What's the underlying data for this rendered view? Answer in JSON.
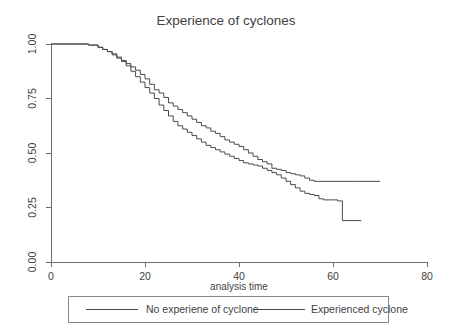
{
  "chart_data": {
    "type": "line",
    "subtype": "kaplan-meier-survival-step",
    "title": "Experience of cyclones",
    "xlabel": "analysis time",
    "ylabel": "",
    "xlim": [
      0,
      80
    ],
    "ylim": [
      0,
      1
    ],
    "xticks": [
      0,
      20,
      40,
      60,
      80
    ],
    "xtick_labels": [
      "0",
      "20",
      "40",
      "60",
      "80"
    ],
    "yticks": [
      0.0,
      0.25,
      0.5,
      0.75,
      1.0
    ],
    "ytick_labels": [
      "0.00",
      "0.25",
      "0.50",
      "0.75",
      "1.00"
    ],
    "grid": false,
    "legend_position": "below",
    "line_color": "#4a4a4a",
    "background_color": "#ffffff",
    "series": [
      {
        "name": "No experiene of cyclone",
        "color": "#4a4a4a",
        "points": [
          [
            0,
            1.0
          ],
          [
            6,
            1.0
          ],
          [
            8,
            0.995
          ],
          [
            10,
            0.985
          ],
          [
            11,
            0.975
          ],
          [
            12,
            0.965
          ],
          [
            13,
            0.95
          ],
          [
            14,
            0.935
          ],
          [
            15,
            0.92
          ],
          [
            16,
            0.9
          ],
          [
            17,
            0.875
          ],
          [
            18,
            0.85
          ],
          [
            19,
            0.825
          ],
          [
            20,
            0.8
          ],
          [
            21,
            0.775
          ],
          [
            22,
            0.75
          ],
          [
            23,
            0.72
          ],
          [
            24,
            0.695
          ],
          [
            25,
            0.67
          ],
          [
            26,
            0.645
          ],
          [
            27,
            0.625
          ],
          [
            28,
            0.61
          ],
          [
            29,
            0.595
          ],
          [
            30,
            0.58
          ],
          [
            31,
            0.565
          ],
          [
            32,
            0.55
          ],
          [
            33,
            0.535
          ],
          [
            34,
            0.525
          ],
          [
            35,
            0.515
          ],
          [
            36,
            0.505
          ],
          [
            37,
            0.495
          ],
          [
            38,
            0.485
          ],
          [
            39,
            0.475
          ],
          [
            40,
            0.465
          ],
          [
            41,
            0.455
          ],
          [
            42,
            0.45
          ],
          [
            43,
            0.445
          ],
          [
            44,
            0.44
          ],
          [
            45,
            0.43
          ],
          [
            46,
            0.42
          ],
          [
            47,
            0.41
          ],
          [
            48,
            0.4
          ],
          [
            49,
            0.385
          ],
          [
            50,
            0.37
          ],
          [
            51,
            0.355
          ],
          [
            52,
            0.34
          ],
          [
            53,
            0.325
          ],
          [
            54,
            0.315
          ],
          [
            55,
            0.31
          ],
          [
            56,
            0.305
          ],
          [
            57,
            0.29
          ],
          [
            58,
            0.285
          ],
          [
            59,
            0.285
          ],
          [
            60,
            0.285
          ],
          [
            61,
            0.28
          ],
          [
            62,
            0.19
          ],
          [
            66,
            0.19
          ]
        ]
      },
      {
        "name": "Experienced cyclone",
        "color": "#4a4a4a",
        "points": [
          [
            0,
            1.0
          ],
          [
            6,
            1.0
          ],
          [
            8,
            0.995
          ],
          [
            10,
            0.985
          ],
          [
            11,
            0.975
          ],
          [
            12,
            0.965
          ],
          [
            13,
            0.955
          ],
          [
            14,
            0.94
          ],
          [
            15,
            0.925
          ],
          [
            16,
            0.91
          ],
          [
            17,
            0.895
          ],
          [
            18,
            0.88
          ],
          [
            19,
            0.86
          ],
          [
            20,
            0.84
          ],
          [
            21,
            0.815
          ],
          [
            22,
            0.79
          ],
          [
            23,
            0.775
          ],
          [
            24,
            0.755
          ],
          [
            25,
            0.73
          ],
          [
            26,
            0.715
          ],
          [
            27,
            0.7
          ],
          [
            28,
            0.685
          ],
          [
            29,
            0.67
          ],
          [
            30,
            0.655
          ],
          [
            31,
            0.64
          ],
          [
            32,
            0.625
          ],
          [
            33,
            0.615
          ],
          [
            34,
            0.6
          ],
          [
            35,
            0.59
          ],
          [
            36,
            0.575
          ],
          [
            37,
            0.56
          ],
          [
            38,
            0.55
          ],
          [
            39,
            0.54
          ],
          [
            40,
            0.53
          ],
          [
            41,
            0.515
          ],
          [
            42,
            0.5
          ],
          [
            43,
            0.485
          ],
          [
            44,
            0.47
          ],
          [
            45,
            0.46
          ],
          [
            46,
            0.45
          ],
          [
            47,
            0.43
          ],
          [
            48,
            0.425
          ],
          [
            49,
            0.42
          ],
          [
            50,
            0.41
          ],
          [
            51,
            0.405
          ],
          [
            52,
            0.4
          ],
          [
            53,
            0.395
          ],
          [
            54,
            0.385
          ],
          [
            55,
            0.375
          ],
          [
            56,
            0.37
          ],
          [
            57,
            0.37
          ],
          [
            60,
            0.37
          ],
          [
            65,
            0.37
          ],
          [
            70,
            0.37
          ]
        ]
      }
    ],
    "annotations": [
      "Curves overlap from time 0 to about 12, then diverge",
      "Curves cross at about time 46 near survival 0.46",
      "Experienced cyclone plateaus at 0.37 through time 70",
      "No experiene of cyclone ends at 0.19 at time 66"
    ]
  },
  "legend": {
    "entries": [
      {
        "label": "No experiene of cyclone"
      },
      {
        "label": "Experienced cyclone"
      }
    ]
  }
}
